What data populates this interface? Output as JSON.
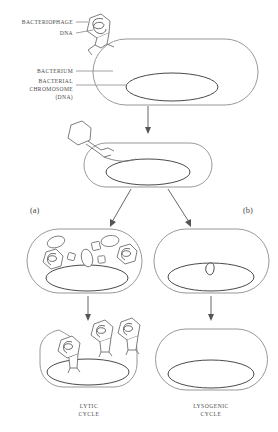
{
  "figure": {
    "background_color": "#ffffff",
    "line_color": "#6f6f6f",
    "text_color": "#4b4b4b"
  },
  "labels": {
    "bacteriophage": "BACTERIOPHAGE",
    "dna": "DNA",
    "bacterium": "BACTERIUM",
    "bacterial_chromosome_line1": "BACTERIAL",
    "bacterial_chromosome_line2": "CHROMOSOME",
    "bacterial_chromosome_line3": "(DNA)"
  },
  "branches": {
    "left": "(a)",
    "right": "(b)"
  },
  "cycles": {
    "lytic_line1": "LYTIC",
    "lytic_line2": "CYCLE",
    "lysogenic_line1": "LYSOGENIC",
    "lysogenic_line2": "CYCLE"
  },
  "stages": [
    {
      "id": "attachment",
      "name": "phage-attached-to-bacterium",
      "description": "Bacteriophage with DNA attached to bacterium surface"
    },
    {
      "id": "injection",
      "name": "phage-dna-injection",
      "description": "Empty phage head injecting DNA into bacterium"
    },
    {
      "id": "lytic-replication",
      "name": "lytic-replication-cell",
      "description": "Cell filled with new phage heads, DNA and capsid parts"
    },
    {
      "id": "lysogenic-integration",
      "name": "lysogenic-prophage-cell",
      "description": "Phage DNA integrated into bacterial chromosome as prophage"
    },
    {
      "id": "lysis",
      "name": "cell-lysis-release",
      "description": "Cell bursting releasing assembled bacteriophages"
    },
    {
      "id": "division",
      "name": "lysogenic-daughter-cell",
      "description": "Bacterium continues dividing carrying prophage"
    }
  ],
  "icons": {
    "phage": "bacteriophage-icon",
    "bacterium": "bacterium-icon",
    "chromosome": "chromosome-icon",
    "arrow": "arrow-icon"
  }
}
